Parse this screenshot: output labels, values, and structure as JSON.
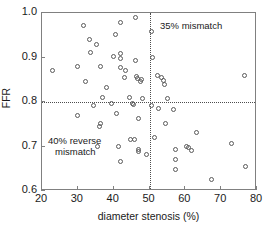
{
  "chart_data": {
    "type": "scatter",
    "title": "",
    "xlabel": "diameter stenosis (%)",
    "ylabel": "FFR",
    "xlim": [
      20,
      80
    ],
    "ylim": [
      0.6,
      1.0
    ],
    "xticks": [
      20,
      30,
      40,
      50,
      60,
      70,
      80
    ],
    "xtick_labels": [
      "20",
      "30",
      "40",
      "50",
      "60",
      "70",
      "80"
    ],
    "yticks": [
      0.6,
      0.7,
      0.8,
      0.9,
      1.0
    ],
    "ytick_labels": [
      "0.6",
      "0.7",
      "0.8",
      "0.9",
      "1.0"
    ],
    "grid": false,
    "legend": "none",
    "marker": "open-circle",
    "marker_color": "#5a5a5a",
    "reference_lines": [
      {
        "axis": "y",
        "value": 0.8,
        "style": "dotted",
        "color": "#4d4d4d"
      },
      {
        "axis": "x",
        "value": 50,
        "style": "dotted",
        "color": "#4d4d4d"
      }
    ],
    "annotations": [
      {
        "text": "35% mismatch",
        "x": 56,
        "y": 0.985,
        "quadrant": "upper-right"
      },
      {
        "text": "40% reverse",
        "x": 23,
        "y": 0.675,
        "quadrant": "lower-left"
      },
      {
        "text": "mismatch",
        "x": 25,
        "y": 0.65,
        "quadrant": "lower-left"
      }
    ],
    "points": [
      {
        "x": 23.0,
        "y": 0.87
      },
      {
        "x": 29.8,
        "y": 0.88
      },
      {
        "x": 29.8,
        "y": 0.77
      },
      {
        "x": 31.5,
        "y": 0.973
      },
      {
        "x": 32.2,
        "y": 0.845
      },
      {
        "x": 33.2,
        "y": 0.94
      },
      {
        "x": 33.6,
        "y": 0.912
      },
      {
        "x": 34.3,
        "y": 0.792
      },
      {
        "x": 35.2,
        "y": 0.93
      },
      {
        "x": 35.5,
        "y": 0.7
      },
      {
        "x": 36.2,
        "y": 0.879
      },
      {
        "x": 36.4,
        "y": 0.751
      },
      {
        "x": 36.0,
        "y": 0.745
      },
      {
        "x": 36.8,
        "y": 0.81
      },
      {
        "x": 38.0,
        "y": 0.833
      },
      {
        "x": 39.3,
        "y": 0.796
      },
      {
        "x": 40.0,
        "y": 0.903
      },
      {
        "x": 40.5,
        "y": 0.951
      },
      {
        "x": 40.8,
        "y": 0.775
      },
      {
        "x": 41.3,
        "y": 0.7
      },
      {
        "x": 41.8,
        "y": 0.978
      },
      {
        "x": 42.0,
        "y": 0.91
      },
      {
        "x": 42.0,
        "y": 0.897
      },
      {
        "x": 42.0,
        "y": 0.877
      },
      {
        "x": 41.8,
        "y": 0.667
      },
      {
        "x": 43.0,
        "y": 0.855
      },
      {
        "x": 43.2,
        "y": 0.871
      },
      {
        "x": 44.5,
        "y": 0.81
      },
      {
        "x": 44.8,
        "y": 0.716
      },
      {
        "x": 45.3,
        "y": 0.797
      },
      {
        "x": 45.6,
        "y": 0.795
      },
      {
        "x": 45.8,
        "y": 0.716
      },
      {
        "x": 46.0,
        "y": 0.989
      },
      {
        "x": 46.2,
        "y": 0.893
      },
      {
        "x": 46.5,
        "y": 0.858
      },
      {
        "x": 46.6,
        "y": 0.852
      },
      {
        "x": 46.8,
        "y": 0.762
      },
      {
        "x": 46.8,
        "y": 0.694
      },
      {
        "x": 46.9,
        "y": 0.689
      },
      {
        "x": 47.5,
        "y": 0.846
      },
      {
        "x": 47.8,
        "y": 0.851
      },
      {
        "x": 48.0,
        "y": 0.808
      },
      {
        "x": 49.2,
        "y": 0.681
      },
      {
        "x": 50.5,
        "y": 0.959
      },
      {
        "x": 50.8,
        "y": 0.901
      },
      {
        "x": 50.6,
        "y": 0.793
      },
      {
        "x": 51.5,
        "y": 0.721
      },
      {
        "x": 52.3,
        "y": 0.859
      },
      {
        "x": 52.6,
        "y": 0.786
      },
      {
        "x": 53.3,
        "y": 0.855
      },
      {
        "x": 53.8,
        "y": 0.848
      },
      {
        "x": 54.2,
        "y": 0.839
      },
      {
        "x": 54.4,
        "y": 0.751
      },
      {
        "x": 55.0,
        "y": 0.808
      },
      {
        "x": 56.8,
        "y": 0.784
      },
      {
        "x": 57.2,
        "y": 0.693
      },
      {
        "x": 57.2,
        "y": 0.67
      },
      {
        "x": 57.3,
        "y": 0.648
      },
      {
        "x": 60.2,
        "y": 0.701
      },
      {
        "x": 61.0,
        "y": 0.697
      },
      {
        "x": 61.8,
        "y": 0.691
      },
      {
        "x": 63.0,
        "y": 0.731
      },
      {
        "x": 67.2,
        "y": 0.625
      },
      {
        "x": 73.0,
        "y": 0.706
      },
      {
        "x": 76.4,
        "y": 0.859
      },
      {
        "x": 76.8,
        "y": 0.656
      }
    ]
  },
  "axes": {
    "x_title": "diameter stenosis (%)",
    "y_title": "FFR"
  },
  "annotations_text": {
    "upper_right": "35% mismatch",
    "lower_left_line1": "40% reverse",
    "lower_left_line2": "mismatch"
  }
}
